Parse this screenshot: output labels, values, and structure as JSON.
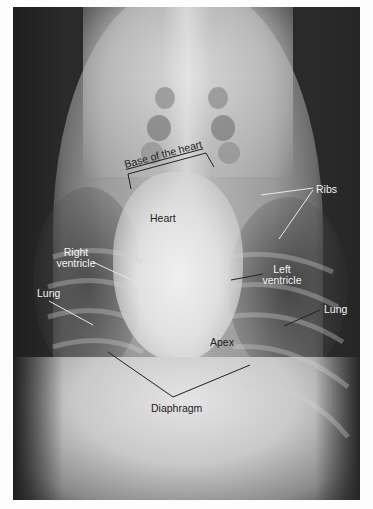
{
  "figure": {
    "type": "radiograph",
    "labels": {
      "base_of_heart": "Base of the heart",
      "heart": "Heart",
      "ribs": "Ribs",
      "right_ventricle_line1": "Right",
      "right_ventricle_line2": "ventricle",
      "left_ventricle_line1": "Left",
      "left_ventricle_line2": "ventricle",
      "lung_left_side": "Lung",
      "lung_right_side": "Lung",
      "apex": "Apex",
      "diaphragm": "Diaphragm"
    },
    "colors": {
      "frame_background": "#fdfdfd",
      "label_light": "#f4f4f4",
      "label_dark": "#222222",
      "leader_line_light": "#e8e8e8",
      "leader_line_dark": "#222222"
    }
  }
}
